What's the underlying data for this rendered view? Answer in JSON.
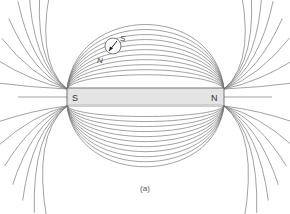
{
  "figure": {
    "caption": "(a)",
    "magnet": {
      "left_pole_label": "S",
      "right_pole_label": "N",
      "fill_color": "#e4e4e4"
    },
    "compass": {
      "north_label": "N",
      "south_label": "S",
      "icon": "compass-needle-icon"
    },
    "field_line_color": "#7a7a7a"
  }
}
